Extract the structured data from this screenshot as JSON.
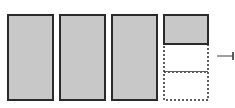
{
  "diagram": {
    "wholes_full": 3,
    "partial": {
      "shaded_parts": 1,
      "total_parts": 3
    },
    "colors": {
      "fill": "#c8c8c8",
      "stroke": "#2a2a2a",
      "background": "#ffffff",
      "pointer": "#808080"
    },
    "bars": [
      {
        "x": 8,
        "y": 15,
        "w": 45,
        "h": 85,
        "type": "full"
      },
      {
        "x": 60,
        "y": 15,
        "w": 45,
        "h": 85,
        "type": "full"
      },
      {
        "x": 112,
        "y": 15,
        "w": 45,
        "h": 85,
        "type": "full"
      }
    ],
    "partial_bar": {
      "x": 164,
      "y": 15,
      "w": 44,
      "h": 85,
      "segments": [
        {
          "y": 15,
          "h": 29,
          "shaded": true
        },
        {
          "y": 44,
          "h": 28,
          "shaded": false
        },
        {
          "y": 72,
          "h": 28,
          "shaded": false
        }
      ]
    },
    "pointer": {
      "x1": 217,
      "x2": 233,
      "y": 56
    }
  }
}
